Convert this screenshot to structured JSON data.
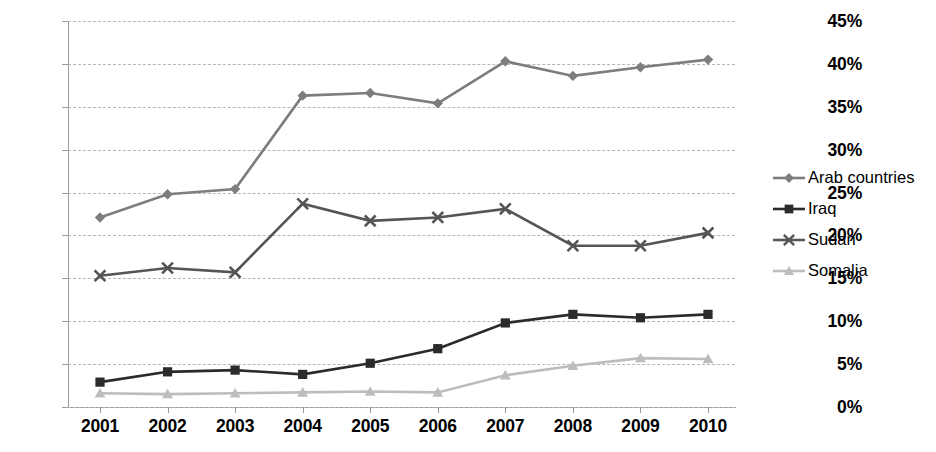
{
  "chart_data": {
    "type": "line",
    "title": "",
    "xlabel": "",
    "ylabel": "",
    "ylim": [
      0,
      45
    ],
    "ytick_labels": [
      "0%",
      "5%",
      "10%",
      "15%",
      "20%",
      "25%",
      "30%",
      "35%",
      "40%",
      "45%"
    ],
    "ytick_values": [
      0,
      5,
      10,
      15,
      20,
      25,
      30,
      35,
      40,
      45
    ],
    "grid": true,
    "legend_position": "right",
    "categories": [
      "2001",
      "2002",
      "2003",
      "2004",
      "2005",
      "2006",
      "2007",
      "2008",
      "2009",
      "2010"
    ],
    "x": [
      2001,
      2002,
      2003,
      2004,
      2005,
      2006,
      2007,
      2008,
      2009,
      2010
    ],
    "series": [
      {
        "name": "Arab countries",
        "marker": "diamond",
        "color": "#7d7d7d",
        "values": [
          22.1,
          24.8,
          25.4,
          36.3,
          36.6,
          35.4,
          40.3,
          38.6,
          39.6,
          40.5
        ]
      },
      {
        "name": "Iraq",
        "marker": "square",
        "color": "#2b2b2b",
        "values": [
          2.9,
          4.1,
          4.3,
          3.8,
          5.1,
          6.8,
          9.8,
          10.8,
          10.4,
          10.8
        ]
      },
      {
        "name": "Sudan",
        "marker": "x",
        "color": "#555555",
        "values": [
          15.3,
          16.2,
          15.7,
          23.7,
          21.7,
          22.1,
          23.1,
          18.8,
          18.8,
          20.3
        ]
      },
      {
        "name": "Somalia",
        "marker": "triangle",
        "color": "#bdbdbd",
        "values": [
          1.6,
          1.5,
          1.6,
          1.7,
          1.8,
          1.7,
          3.7,
          4.8,
          5.7,
          5.6
        ]
      }
    ]
  },
  "legend": {
    "items": [
      {
        "label": "Arab countries"
      },
      {
        "label": "Iraq"
      },
      {
        "label": "Sudan"
      },
      {
        "label": "Somalia"
      }
    ]
  }
}
